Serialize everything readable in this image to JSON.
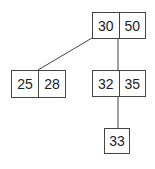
{
  "diagram": {
    "type": "b-tree",
    "nodes": [
      {
        "id": "root",
        "keys": [
          "30",
          "50"
        ]
      },
      {
        "id": "left",
        "keys": [
          "25",
          "28"
        ]
      },
      {
        "id": "middle",
        "keys": [
          "32",
          "35"
        ]
      },
      {
        "id": "bottom",
        "keys": [
          "33"
        ]
      }
    ],
    "edges": [
      {
        "from": "root",
        "to": "left"
      },
      {
        "from": "root",
        "to": "middle"
      },
      {
        "from": "middle",
        "to": "bottom"
      }
    ]
  },
  "colors": {
    "stroke": "#444444",
    "text": "#222222",
    "background": "#ffffff"
  }
}
